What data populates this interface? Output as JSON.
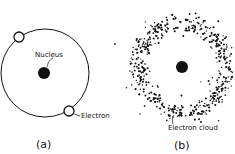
{
  "panel_a": {
    "nucleus_label": "Nucleus",
    "electron_label": "Electron",
    "caption": "(a)"
  },
  "panel_b": {
    "cloud_label": "Electron cloud",
    "caption": "(b)"
  },
  "colors": {
    "ink": "#111111",
    "background": "#ffffff"
  }
}
